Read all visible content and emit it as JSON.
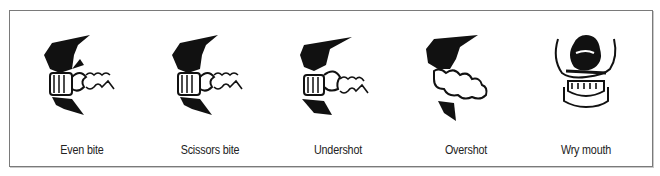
{
  "figure": {
    "panels": [
      {
        "id": "even-bite",
        "label": "Even bite"
      },
      {
        "id": "scissors-bite",
        "label": "Scissors bite"
      },
      {
        "id": "undershot",
        "label": "Undershot"
      },
      {
        "id": "overshot",
        "label": "Overshot"
      },
      {
        "id": "wry-mouth",
        "label": "Wry mouth"
      }
    ]
  },
  "colors": {
    "ink": "#111111",
    "border": "#7a7a7a",
    "background": "#ffffff"
  }
}
